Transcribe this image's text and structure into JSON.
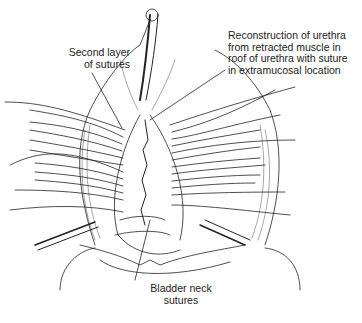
{
  "figure": {
    "type": "surgical illustration"
  },
  "labels": {
    "second_layer": [
      "Second layer",
      "of sutures"
    ],
    "reconstruction": [
      "Reconstruction of urethra",
      "from retracted muscle in",
      "roof of urethra with suture",
      "in extramucosal location"
    ],
    "bladder_neck": [
      "Bladder neck",
      "sutures"
    ]
  },
  "colors": {
    "ink": "#222222",
    "background": "#ffffff"
  }
}
